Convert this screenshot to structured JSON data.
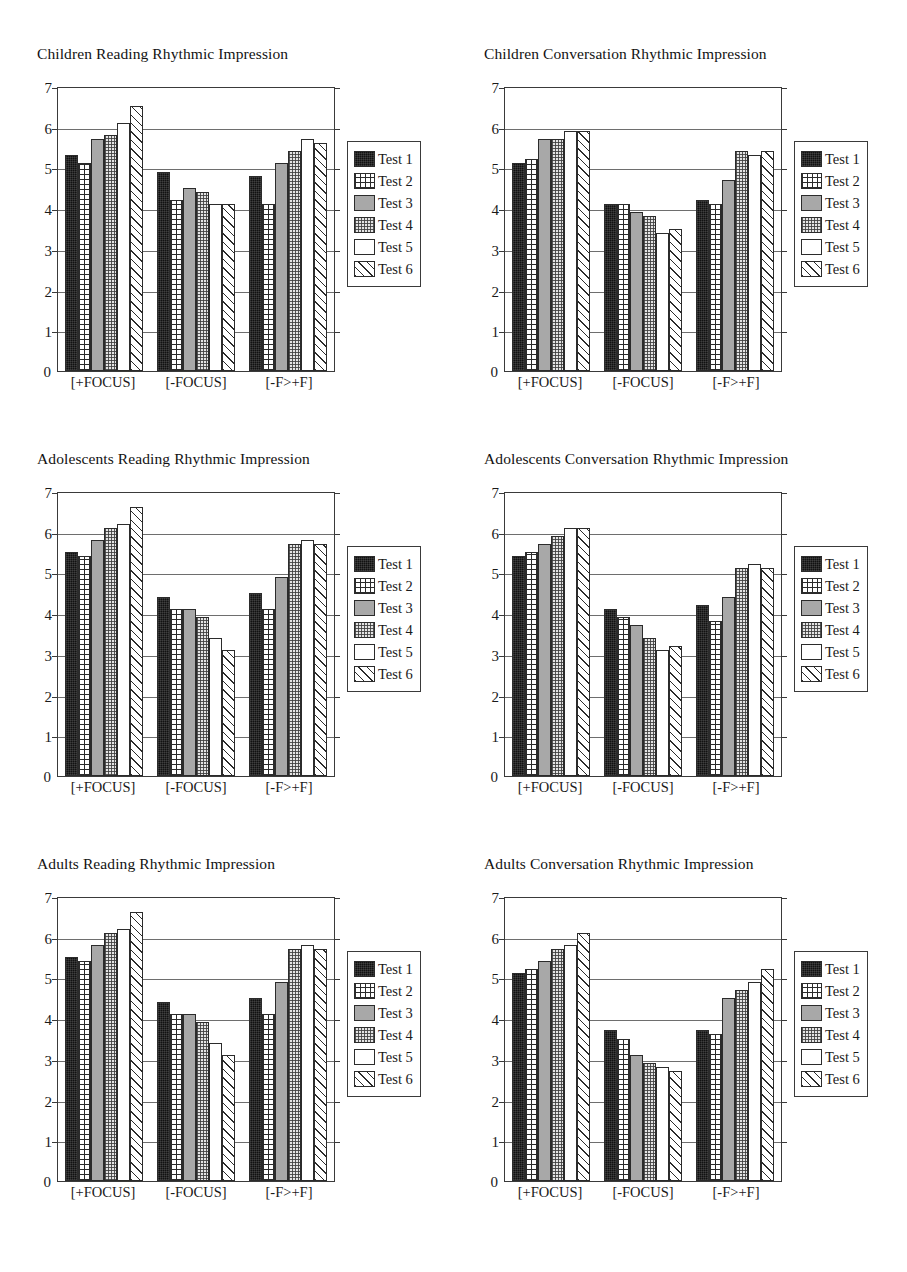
{
  "axis": {
    "y_ticks": [
      "7",
      "6",
      "5",
      "4",
      "3",
      "2",
      "1",
      "0"
    ],
    "zero_label": "0",
    "ymin": 0,
    "ymax": 7
  },
  "legend": {
    "items": [
      {
        "label": "Test 1",
        "pattern": "solid-black"
      },
      {
        "label": "Test 2",
        "pattern": "crosshatch-grid"
      },
      {
        "label": "Test 3",
        "pattern": "solid-gray"
      },
      {
        "label": "Test 4",
        "pattern": "stipple-dots"
      },
      {
        "label": "Test 5",
        "pattern": "white-empty"
      },
      {
        "label": "Test 6",
        "pattern": "diagonal-hatch"
      }
    ]
  },
  "categories": [
    "[+FOCUS]",
    "[-FOCUS]",
    "[-F>+F]"
  ],
  "chart_data": [
    {
      "type": "bar",
      "title": "Children Reading Rhythmic Impression",
      "xlabel": "",
      "ylabel": "",
      "ylim": [
        0,
        7
      ],
      "grid": true,
      "legend_position": "right",
      "categories": [
        "[+FOCUS]",
        "[-FOCUS]",
        "[-F>+F]"
      ],
      "series": [
        {
          "name": "Test 1",
          "values": [
            5.3,
            4.9,
            4.8
          ]
        },
        {
          "name": "Test 2",
          "values": [
            5.1,
            4.2,
            4.1
          ]
        },
        {
          "name": "Test 3",
          "values": [
            5.7,
            4.5,
            5.1
          ]
        },
        {
          "name": "Test 4",
          "values": [
            5.8,
            4.4,
            5.4
          ]
        },
        {
          "name": "Test 5",
          "values": [
            6.1,
            4.1,
            5.7
          ]
        },
        {
          "name": "Test 6",
          "values": [
            6.5,
            4.1,
            5.6
          ]
        }
      ]
    },
    {
      "type": "bar",
      "title": "Children Conversation Rhythmic Impression",
      "xlabel": "",
      "ylabel": "",
      "ylim": [
        0,
        7
      ],
      "grid": true,
      "legend_position": "right",
      "categories": [
        "[+FOCUS]",
        "[-FOCUS]",
        "[-F>+F]"
      ],
      "series": [
        {
          "name": "Test 1",
          "values": [
            5.1,
            4.1,
            4.2
          ]
        },
        {
          "name": "Test 2",
          "values": [
            5.2,
            4.1,
            4.1
          ]
        },
        {
          "name": "Test 3",
          "values": [
            5.7,
            3.9,
            4.7
          ]
        },
        {
          "name": "Test 4",
          "values": [
            5.7,
            3.8,
            5.4
          ]
        },
        {
          "name": "Test 5",
          "values": [
            5.9,
            3.4,
            5.3
          ]
        },
        {
          "name": "Test 6",
          "values": [
            5.9,
            3.5,
            5.4
          ]
        }
      ]
    },
    {
      "type": "bar",
      "title": "Adolescents Reading Rhythmic Impression",
      "xlabel": "",
      "ylabel": "",
      "ylim": [
        0,
        7
      ],
      "grid": true,
      "legend_position": "right",
      "categories": [
        "[+FOCUS]",
        "[-FOCUS]",
        "[-F>+F]"
      ],
      "series": [
        {
          "name": "Test 1",
          "values": [
            5.5,
            4.4,
            4.5
          ]
        },
        {
          "name": "Test 2",
          "values": [
            5.4,
            4.1,
            4.1
          ]
        },
        {
          "name": "Test 3",
          "values": [
            5.8,
            4.1,
            4.9
          ]
        },
        {
          "name": "Test 4",
          "values": [
            6.1,
            3.9,
            5.7
          ]
        },
        {
          "name": "Test 5",
          "values": [
            6.2,
            3.4,
            5.8
          ]
        },
        {
          "name": "Test 6",
          "values": [
            6.6,
            3.1,
            5.7
          ]
        }
      ]
    },
    {
      "type": "bar",
      "title": "Adolescents Conversation Rhythmic Impression",
      "xlabel": "",
      "ylabel": "",
      "ylim": [
        0,
        7
      ],
      "grid": true,
      "legend_position": "right",
      "categories": [
        "[+FOCUS]",
        "[-FOCUS]",
        "[-F>+F]"
      ],
      "series": [
        {
          "name": "Test 1",
          "values": [
            5.4,
            4.1,
            4.2
          ]
        },
        {
          "name": "Test 2",
          "values": [
            5.5,
            3.9,
            3.8
          ]
        },
        {
          "name": "Test 3",
          "values": [
            5.7,
            3.7,
            4.4
          ]
        },
        {
          "name": "Test 4",
          "values": [
            5.9,
            3.4,
            5.1
          ]
        },
        {
          "name": "Test 5",
          "values": [
            6.1,
            3.1,
            5.2
          ]
        },
        {
          "name": "Test 6",
          "values": [
            6.1,
            3.2,
            5.1
          ]
        }
      ]
    },
    {
      "type": "bar",
      "title": "Adults Reading Rhythmic Impression",
      "xlabel": "",
      "ylabel": "",
      "ylim": [
        0,
        7
      ],
      "grid": true,
      "legend_position": "right",
      "categories": [
        "[+FOCUS]",
        "[-FOCUS]",
        "[-F>+F]"
      ],
      "series": [
        {
          "name": "Test 1",
          "values": [
            5.5,
            4.4,
            4.5
          ]
        },
        {
          "name": "Test 2",
          "values": [
            5.4,
            4.1,
            4.1
          ]
        },
        {
          "name": "Test 3",
          "values": [
            5.8,
            4.1,
            4.9
          ]
        },
        {
          "name": "Test 4",
          "values": [
            6.1,
            3.9,
            5.7
          ]
        },
        {
          "name": "Test 5",
          "values": [
            6.2,
            3.4,
            5.8
          ]
        },
        {
          "name": "Test 6",
          "values": [
            6.6,
            3.1,
            5.7
          ]
        }
      ]
    },
    {
      "type": "bar",
      "title": "Adults Conversation Rhythmic Impression",
      "xlabel": "",
      "ylabel": "",
      "ylim": [
        0,
        7
      ],
      "grid": true,
      "legend_position": "right",
      "categories": [
        "[+FOCUS]",
        "[-FOCUS]",
        "[-F>+F]"
      ],
      "series": [
        {
          "name": "Test 1",
          "values": [
            5.1,
            3.7,
            3.7
          ]
        },
        {
          "name": "Test 2",
          "values": [
            5.2,
            3.5,
            3.6
          ]
        },
        {
          "name": "Test 3",
          "values": [
            5.4,
            3.1,
            4.5
          ]
        },
        {
          "name": "Test 4",
          "values": [
            5.7,
            2.9,
            4.7
          ]
        },
        {
          "name": "Test 5",
          "values": [
            5.8,
            2.8,
            4.9
          ]
        },
        {
          "name": "Test 6",
          "values": [
            6.1,
            2.7,
            5.2
          ]
        }
      ]
    }
  ]
}
